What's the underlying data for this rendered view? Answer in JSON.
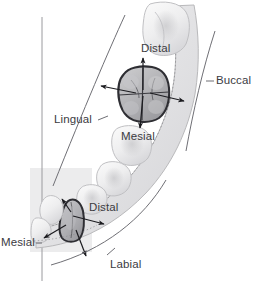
{
  "figure": {
    "midline_label": "dental midline"
  },
  "labels": {
    "buccal": "Buccal",
    "lingual": "Lingual",
    "labial": "Labial",
    "distal_upper": "Distal",
    "mesial_upper": "Mesial",
    "distal_lower": "Distal",
    "mesial_lower": "Mesial"
  },
  "colors": {
    "background": "#ffffff",
    "text": "#3b3b3f",
    "leader_line": "#6f6f75",
    "arrow": "#1c1c20",
    "highlight_outline": "#2e2e33",
    "arch_fill": "#e9e9ea",
    "arch_stroke": "#b9b9bb",
    "tooth_fill": "#f3f3f3",
    "tooth_stroke": "#c3c3c5",
    "midline": "#9a9a9e",
    "shadow": "#cfcfd2"
  },
  "arrows": {
    "molar": [
      {
        "name": "distal-arrow",
        "direction": "up"
      },
      {
        "name": "mesial-arrow",
        "direction": "down"
      },
      {
        "name": "lingual-arrow",
        "direction": "left"
      },
      {
        "name": "buccal-arrow",
        "direction": "right"
      }
    ],
    "incisor": [
      {
        "name": "distal-arrow",
        "direction": "right"
      },
      {
        "name": "mesial-arrow",
        "direction": "left"
      },
      {
        "name": "lingual-arrow",
        "direction": "up"
      },
      {
        "name": "labial-arrow",
        "direction": "down"
      }
    ]
  }
}
